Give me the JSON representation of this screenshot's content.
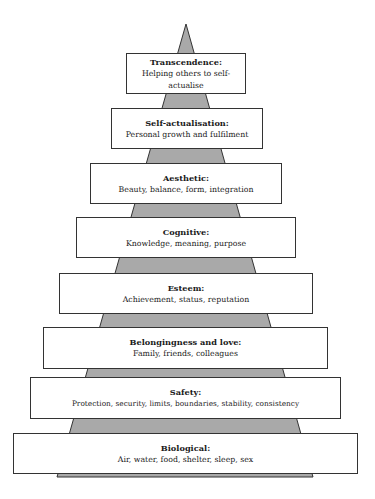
{
  "diagram": {
    "type": "pyramid",
    "colors": {
      "pyramid_fill": "#a9a9a9",
      "pyramid_stroke": "#333333",
      "box_fill": "#ffffff",
      "box_border": "#333333"
    },
    "levels": [
      {
        "title": "Transcendence:",
        "description": "Helping others to self-actualise",
        "desc_lines": [
          "Helping others to self-",
          "actualise"
        ]
      },
      {
        "title": "Self-actualisation:",
        "description": "Personal growth and fulfilment"
      },
      {
        "title": "Aesthetic:",
        "description": "Beauty, balance, form, integration"
      },
      {
        "title": "Cognitive:",
        "description": "Knowledge, meaning, purpose"
      },
      {
        "title": "Esteem:",
        "description": "Achievement, status, reputation"
      },
      {
        "title": "Belongingness and love:",
        "description": "Family, friends, colleagues"
      },
      {
        "title": "Safety:",
        "description": "Protection, security, limits, boundaries, stability, consistency"
      },
      {
        "title": "Biological:",
        "description": "Air, water, food, shelter, sleep, sex"
      }
    ]
  }
}
